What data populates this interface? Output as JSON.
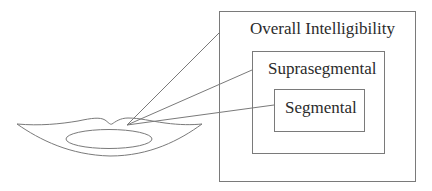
{
  "diagram": {
    "levels": [
      {
        "id": "overall",
        "label": "Overall Intelligibility"
      },
      {
        "id": "suprasegmental",
        "label": "Suprasegmental"
      },
      {
        "id": "segmental",
        "label": "Segmental"
      }
    ],
    "source_icon": "lips-mouth-icon",
    "colors": {
      "stroke": "#7a7a7a",
      "text": "#2b2b2b",
      "background": "#ffffff"
    }
  }
}
